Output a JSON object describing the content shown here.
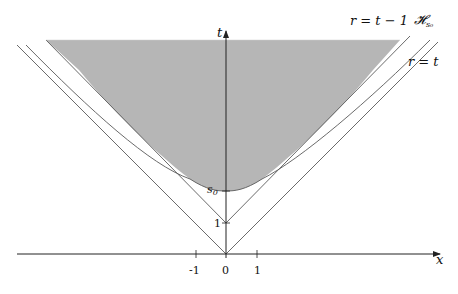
{
  "figure": {
    "type": "spacetime-diagram",
    "axes": {
      "x_label": "x",
      "t_label": "t",
      "x_ticks": [
        {
          "value": -1,
          "label": "-1"
        },
        {
          "value": 0,
          "label": "0"
        },
        {
          "value": 1,
          "label": "1"
        }
      ],
      "t_ticks": [
        {
          "value": 1,
          "label": "1"
        },
        {
          "value": 2.06,
          "label": "s₀"
        }
      ]
    },
    "curves": {
      "light_cone": "r = t",
      "shifted_cone": "r = t − 1",
      "hyperboloid": "𝓗",
      "hyperboloid_sub": "s₀"
    },
    "labels": {
      "r_eq_t_minus_1": "r = t − 1",
      "h_s0": "𝓗",
      "h_s0_sub": "s₀",
      "r_eq_t": "r = t",
      "s0": "s",
      "s0_sub": "0",
      "one_t": "1",
      "x_axis": "x",
      "t_axis": "t",
      "tick_m1": "-1",
      "tick_0": "0",
      "tick_1": "1"
    },
    "colors": {
      "shade": "#b4b4b4",
      "line": "#555555",
      "axis": "#222222"
    }
  }
}
